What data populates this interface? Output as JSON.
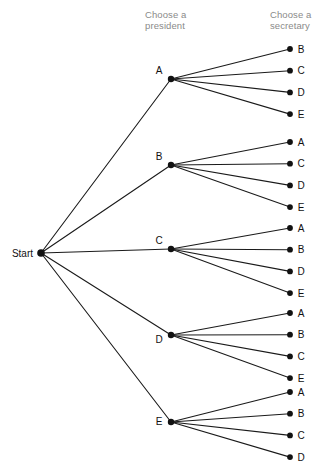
{
  "diagram": {
    "title_hidden": "",
    "headers": {
      "president": "Choose a\npresident",
      "secretary": "Choose a\nsecretary"
    },
    "root": {
      "label": "Start",
      "x": 41,
      "y": 253
    },
    "colors": {
      "node": "#111111",
      "edge": "#1a1a1a",
      "header_text": "#8a8a8a",
      "label_text": "#111111",
      "background": "#ffffff"
    },
    "geometry": {
      "level1_x": 171,
      "level2_x": 290,
      "node_radius": 3.2,
      "leaf_radius": 2.9,
      "leaf_spacing": 21.7,
      "edge_width": 1.1
    },
    "levels": [
      {
        "name": "president",
        "options": [
          "A",
          "B",
          "C",
          "D",
          "E"
        ]
      },
      {
        "name": "secretary",
        "options": [
          "A",
          "B",
          "C",
          "D",
          "E"
        ]
      }
    ],
    "branches": [
      {
        "label": "A",
        "x": 171,
        "y": 79,
        "label_dx": -12,
        "label_dy": -5,
        "leaves": [
          {
            "label": "B",
            "x": 290,
            "y": 49
          },
          {
            "label": "C",
            "x": 290,
            "y": 70.7
          },
          {
            "label": "D",
            "x": 290,
            "y": 92.4
          },
          {
            "label": "E",
            "x": 290,
            "y": 114.1
          }
        ]
      },
      {
        "label": "B",
        "x": 171,
        "y": 165,
        "label_dx": -12,
        "label_dy": -5,
        "leaves": [
          {
            "label": "A",
            "x": 290,
            "y": 142
          },
          {
            "label": "C",
            "x": 290,
            "y": 163.7
          },
          {
            "label": "D",
            "x": 290,
            "y": 185.4
          },
          {
            "label": "E",
            "x": 290,
            "y": 207.1
          }
        ]
      },
      {
        "label": "C",
        "x": 171,
        "y": 249,
        "label_dx": -12,
        "label_dy": -5,
        "leaves": [
          {
            "label": "A",
            "x": 290,
            "y": 228
          },
          {
            "label": "B",
            "x": 290,
            "y": 249.7
          },
          {
            "label": "D",
            "x": 290,
            "y": 271.4
          },
          {
            "label": "E",
            "x": 290,
            "y": 293.1
          }
        ]
      },
      {
        "label": "D",
        "x": 171,
        "y": 335,
        "label_dx": -12,
        "label_dy": 8,
        "leaves": [
          {
            "label": "A",
            "x": 290,
            "y": 313
          },
          {
            "label": "B",
            "x": 290,
            "y": 334.7
          },
          {
            "label": "C",
            "x": 290,
            "y": 356.4
          },
          {
            "label": "E",
            "x": 290,
            "y": 378.1
          }
        ]
      },
      {
        "label": "E",
        "x": 171,
        "y": 422,
        "label_dx": -12,
        "label_dy": 3,
        "leaves": [
          {
            "label": "A",
            "x": 290,
            "y": 392
          },
          {
            "label": "B",
            "x": 290,
            "y": 413.7
          },
          {
            "label": "C",
            "x": 290,
            "y": 435.4
          },
          {
            "label": "D",
            "x": 290,
            "y": 457.1
          }
        ]
      }
    ]
  }
}
